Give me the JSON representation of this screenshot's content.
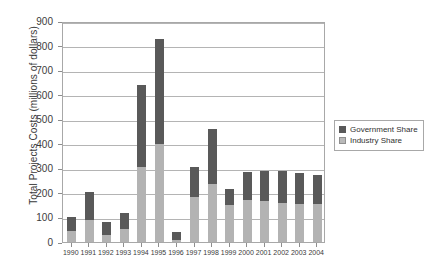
{
  "chart_data": {
    "type": "bar",
    "subtype": "stacked-vertical",
    "title": "",
    "xlabel": "",
    "ylabel": "Total Projects Costs (millions of dollars)",
    "ylim": [
      0,
      900
    ],
    "ytick_step": 100,
    "yticks": [
      "0",
      "100",
      "200",
      "300",
      "400",
      "500",
      "600",
      "700",
      "800",
      "900"
    ],
    "grid": true,
    "legend_position": "right",
    "categories": [
      "1990",
      "1991",
      "1992",
      "1993",
      "1994",
      "1995",
      "1996",
      "1997",
      "1998",
      "1999",
      "2000",
      "2001",
      "2002",
      "2003",
      "2004"
    ],
    "series": [
      {
        "name": "Industry Share",
        "color": "#b3b3b3",
        "values": [
          45,
          90,
          30,
          55,
          305,
          400,
          10,
          185,
          235,
          150,
          170,
          165,
          160,
          155,
          155
        ]
      },
      {
        "name": "Government Share",
        "color": "#595959",
        "values": [
          55,
          115,
          50,
          65,
          335,
          425,
          30,
          120,
          225,
          65,
          115,
          125,
          130,
          125,
          120
        ]
      }
    ],
    "totals": [
      100,
      205,
      80,
      120,
      640,
      825,
      40,
      305,
      460,
      215,
      285,
      290,
      290,
      280,
      275
    ]
  },
  "legend": {
    "entries": [
      {
        "label": "Government Share",
        "swatch": "gov"
      },
      {
        "label": "Industry Share",
        "swatch": "ind"
      }
    ]
  },
  "colors": {
    "government": "#595959",
    "industry": "#b3b3b3",
    "gridline": "#b4b4b4",
    "axis": "#a8a8a8",
    "text": "#3b3b3b",
    "background": "#ffffff"
  }
}
